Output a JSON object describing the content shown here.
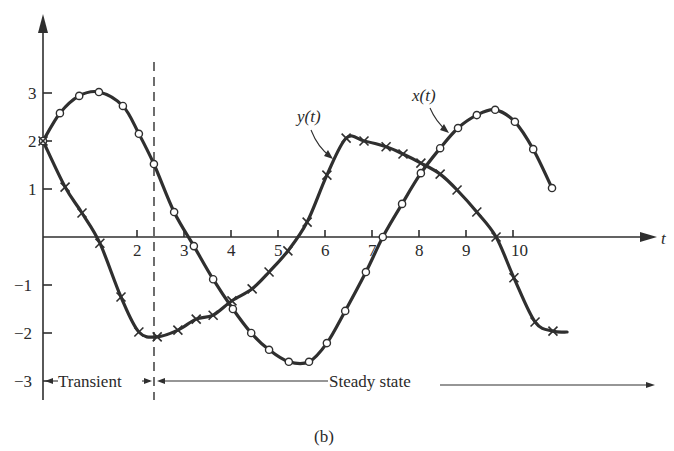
{
  "figure": {
    "caption": "(b)",
    "x_axis_label": "t",
    "annotations": {
      "transient": "Transient",
      "steady_state": "Steady state",
      "x_label": "x(t)",
      "y_label": "y(t)"
    },
    "colors": {
      "ink": "#2f2f2f",
      "background": "#ffffff"
    }
  },
  "chart_data": {
    "type": "line",
    "title": "",
    "caption": "(b)",
    "xlabel": "t",
    "ylabel": "",
    "xlim": [
      0,
      11.5
    ],
    "ylim": [
      -3.3,
      4.1
    ],
    "x_ticks": [
      2,
      3,
      4,
      5,
      6,
      7,
      8,
      9,
      10
    ],
    "y_ticks": [
      3,
      2,
      1,
      -1,
      -2,
      -3
    ],
    "grid": false,
    "legend": "none (curves labeled inline with arrows)",
    "transient_boundary_t": 2.35,
    "regions": [
      {
        "label": "Transient",
        "t_start": 0,
        "t_end": 2.35
      },
      {
        "label": "Steady state",
        "t_start": 2.35,
        "t_end": 11.7
      }
    ],
    "series": [
      {
        "name": "x(t)",
        "marker": "circle",
        "points": [
          [
            0,
            2.0
          ],
          [
            0.36,
            2.58
          ],
          [
            0.77,
            2.94
          ],
          [
            1.19,
            3.02
          ],
          [
            1.7,
            2.73
          ],
          [
            2.04,
            2.15
          ],
          [
            2.36,
            1.52
          ],
          [
            2.79,
            0.52
          ],
          [
            3.21,
            -0.19
          ],
          [
            3.62,
            -0.88
          ],
          [
            4.04,
            -1.5
          ],
          [
            4.43,
            -2.0
          ],
          [
            4.81,
            -2.35
          ],
          [
            5.23,
            -2.6
          ],
          [
            5.66,
            -2.6
          ],
          [
            6.04,
            -2.21
          ],
          [
            6.43,
            -1.54
          ],
          [
            6.87,
            -0.73
          ],
          [
            7.23,
            0.0
          ],
          [
            7.64,
            0.69
          ],
          [
            8.04,
            1.33
          ],
          [
            8.45,
            1.85
          ],
          [
            8.83,
            2.27
          ],
          [
            9.23,
            2.54
          ],
          [
            9.62,
            2.65
          ],
          [
            10.04,
            2.4
          ],
          [
            10.43,
            1.83
          ],
          [
            10.83,
            1.02
          ]
        ],
        "label_position": [
          8.1,
          3.3
        ]
      },
      {
        "name": "y(t)",
        "marker": "cross",
        "points": [
          [
            0,
            2.0
          ],
          [
            0.47,
            1.04
          ],
          [
            0.83,
            0.5
          ],
          [
            1.21,
            -0.13
          ],
          [
            1.66,
            -1.25
          ],
          [
            2.04,
            -1.98
          ],
          [
            2.43,
            -2.08
          ],
          [
            2.87,
            -1.94
          ],
          [
            3.26,
            -1.71
          ],
          [
            3.62,
            -1.63
          ],
          [
            4.02,
            -1.33
          ],
          [
            4.45,
            -1.08
          ],
          [
            4.81,
            -0.73
          ],
          [
            5.21,
            -0.29
          ],
          [
            5.62,
            0.31
          ],
          [
            6.04,
            1.29
          ],
          [
            6.45,
            2.06
          ],
          [
            6.83,
            2.0
          ],
          [
            7.3,
            1.88
          ],
          [
            7.66,
            1.73
          ],
          [
            8.04,
            1.54
          ],
          [
            8.45,
            1.31
          ],
          [
            8.81,
            0.98
          ],
          [
            9.23,
            0.52
          ],
          [
            9.64,
            0.0
          ],
          [
            10.02,
            -0.85
          ],
          [
            10.47,
            -1.77
          ],
          [
            10.85,
            -1.96
          ]
        ],
        "curve_end": [
          11.15,
          -1.98
        ],
        "label_position": [
          5.85,
          2.5
        ]
      }
    ]
  }
}
